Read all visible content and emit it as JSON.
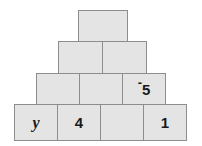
{
  "figure": {
    "name": "number-pyramid",
    "background_color": "#ffffff",
    "block_fill_color": "#e4e4e4",
    "block_border_color": "#8d8d8d",
    "text_color": "#1a1a1a",
    "row_count": 4
  },
  "rows": [
    {
      "index": 1,
      "position": "top",
      "block_count": 1,
      "blocks": [
        {
          "id": "r1c1",
          "value": "",
          "empty": true
        }
      ]
    },
    {
      "index": 2,
      "position": "second",
      "block_count": 2,
      "blocks": [
        {
          "id": "r2c1",
          "value": "",
          "empty": true
        },
        {
          "id": "r2c2",
          "value": "",
          "empty": true
        }
      ]
    },
    {
      "index": 3,
      "position": "third",
      "block_count": 3,
      "blocks": [
        {
          "id": "r3c1",
          "value": "",
          "empty": true
        },
        {
          "id": "r3c2",
          "value": "",
          "empty": true
        },
        {
          "id": "r3c3",
          "value": "-5",
          "sign": "-",
          "magnitude": "5",
          "empty": false,
          "style": "raised-negative"
        }
      ]
    },
    {
      "index": 4,
      "position": "bottom",
      "block_count": 4,
      "blocks": [
        {
          "id": "r4c1",
          "value": "y",
          "empty": false,
          "style": "variable"
        },
        {
          "id": "r4c2",
          "value": "4",
          "empty": false,
          "style": "number"
        },
        {
          "id": "r4c3",
          "value": "",
          "empty": true
        },
        {
          "id": "r4c4",
          "value": "1",
          "empty": false,
          "style": "number"
        }
      ]
    }
  ]
}
